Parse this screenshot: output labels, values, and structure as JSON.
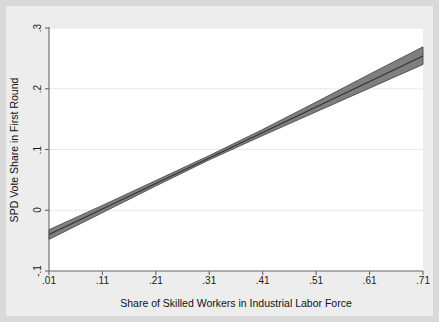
{
  "figure": {
    "background_color": "#d9d9d9",
    "plot_background_color": "#ffffff",
    "band_fill_color": "#7f7f7f",
    "band_edge_color": "#4d4d4d",
    "fit_line_color": "#333333",
    "axis_color": "#666666",
    "gridline_color": "#e8e8e8"
  },
  "chart_data": {
    "type": "line",
    "title": "",
    "xlabel": "Share of Skilled Workers in Industrial Labor Force",
    "ylabel": "SPD Vote Share in First Round",
    "xlim": [
      0.01,
      0.71
    ],
    "ylim": [
      -0.1,
      0.3
    ],
    "xticks": [
      0.01,
      0.11,
      0.21,
      0.31,
      0.41,
      0.51,
      0.61,
      0.71
    ],
    "xtick_labels": [
      ".01",
      ".11",
      ".21",
      ".31",
      ".41",
      ".51",
      ".61",
      ".71"
    ],
    "yticks": [
      -0.1,
      0.0,
      0.1,
      0.2,
      0.3
    ],
    "ytick_labels": [
      "-.1",
      "0",
      ".1",
      ".2",
      ".3"
    ],
    "grid": "horizontal",
    "legend": "none",
    "series": [
      {
        "name": "Linear prediction",
        "x": [
          0.01,
          0.11,
          0.21,
          0.31,
          0.41,
          0.51,
          0.61,
          0.71
        ],
        "values": [
          -0.04,
          0.002,
          0.044,
          0.086,
          0.128,
          0.17,
          0.212,
          0.254
        ]
      },
      {
        "name": "95% confidence interval lower bound",
        "x": [
          0.01,
          0.11,
          0.21,
          0.31,
          0.41,
          0.51,
          0.61,
          0.71
        ],
        "values": [
          -0.048,
          -0.004,
          0.04,
          0.083,
          0.123,
          0.162,
          0.201,
          0.24
        ]
      },
      {
        "name": "95% confidence interval upper bound",
        "x": [
          0.01,
          0.11,
          0.21,
          0.31,
          0.41,
          0.51,
          0.61,
          0.71
        ],
        "values": [
          -0.032,
          0.008,
          0.049,
          0.09,
          0.133,
          0.178,
          0.224,
          0.269
        ]
      }
    ]
  }
}
